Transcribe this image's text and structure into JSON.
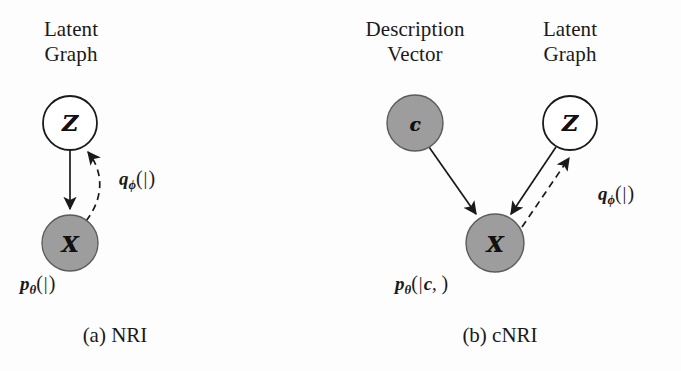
{
  "figure": {
    "background_color": "#fdfdfd",
    "shaded_node_fill": "#9d9d9d",
    "open_node_fill": "#ffffff",
    "stroke_color": "#1a1a1a"
  },
  "panels": [
    {
      "id": "a",
      "caption": "(a) NRI",
      "nodes": [
        {
          "id": "z",
          "glyph": "ℒ",
          "glyph_display": "Z",
          "title_line1": "Latent",
          "title_line2": "Graph",
          "shaded": false,
          "cx": 70,
          "cy": 123,
          "r": 27
        },
        {
          "id": "x",
          "glyph": "X",
          "glyph_display": "X",
          "title_line1": "",
          "title_line2": "",
          "shaded": true,
          "cx": 70,
          "cy": 243,
          "r": 28
        }
      ],
      "edges": [
        {
          "id": "z-to-x",
          "style": "solid",
          "from": "z",
          "to": "x",
          "label": ""
        },
        {
          "id": "x-to-z",
          "style": "dashed",
          "from": "x",
          "to": "z",
          "label": "q_phi(Z|X)"
        }
      ],
      "formulas": {
        "generative": {
          "fn": "p",
          "sub": "θ",
          "args": "(ℒ|ℒ)",
          "display": "p_θ(X|Z)",
          "x": 20,
          "y": 272
        },
        "inference": {
          "fn": "q",
          "sub": "ϕ",
          "display": "q_ϕ(Z|X)",
          "x": 120,
          "y": 168
        }
      }
    },
    {
      "id": "b",
      "caption": "(b) cNRI",
      "nodes": [
        {
          "id": "c",
          "glyph": "c",
          "glyph_display": "c",
          "title_line1": "Description",
          "title_line2": "Vector",
          "shaded": true,
          "cx": 75,
          "cy": 123,
          "r": 28
        },
        {
          "id": "z",
          "glyph": "ℒ",
          "glyph_display": "Z",
          "title_line1": "Latent",
          "title_line2": "Graph",
          "shaded": false,
          "cx": 230,
          "cy": 123,
          "r": 27
        },
        {
          "id": "x",
          "glyph": "X",
          "glyph_display": "X",
          "title_line1": "",
          "title_line2": "",
          "shaded": true,
          "cx": 155,
          "cy": 243,
          "r": 29
        }
      ],
      "edges": [
        {
          "id": "c-to-x",
          "style": "solid",
          "from": "c",
          "to": "x",
          "label": ""
        },
        {
          "id": "z-to-x",
          "style": "solid",
          "from": "z",
          "to": "x",
          "label": ""
        },
        {
          "id": "x-to-z",
          "style": "dashed",
          "from": "x",
          "to": "z",
          "label": "q_phi(Z|X)"
        }
      ],
      "formulas": {
        "generative": {
          "fn": "p",
          "sub": "θ",
          "display": "p_θ(X|c, Z)",
          "x": 55,
          "y": 272
        },
        "inference": {
          "fn": "q",
          "sub": "ϕ",
          "display": "q_ϕ(Z|X)",
          "x": 258,
          "y": 182
        }
      }
    }
  ]
}
